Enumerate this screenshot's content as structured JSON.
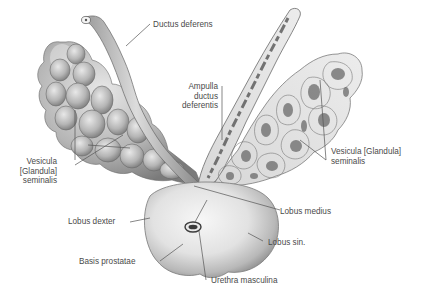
{
  "figure": {
    "type": "anatomical-illustration",
    "colors": {
      "background": "#ffffff",
      "tissue_light": "#e6e6e6",
      "tissue_mid": "#bdbdbd",
      "tissue_dark": "#6f6f6f",
      "outline": "#5a5a5a",
      "leader_line": "#555555",
      "label_text": "#4a4a4a"
    }
  },
  "labels": {
    "ductus_deferens": {
      "lines": [
        "Ductus deferens"
      ]
    },
    "ampulla": {
      "lines": [
        "Ampulla",
        "ductus",
        "deferentis"
      ]
    },
    "vesicula_left": {
      "lines": [
        "Vesicula",
        "[Glandula]",
        "seminalis"
      ]
    },
    "vesicula_right": {
      "lines": [
        "Vesicula [Glandula]",
        "seminalis"
      ]
    },
    "lobus_dexter": {
      "lines": [
        "Lobus dexter"
      ]
    },
    "lobus_medius": {
      "lines": [
        "Lobus medius"
      ]
    },
    "lobus_sin": {
      "lines": [
        "Lobus sin."
      ]
    },
    "basis_prostatae": {
      "lines": [
        "Basis prostatae"
      ]
    },
    "urethra": {
      "lines": [
        "Urethra masculina"
      ]
    }
  }
}
